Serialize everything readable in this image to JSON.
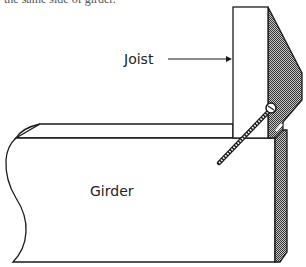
{
  "caption": {
    "partial_text": "the same side of girder."
  },
  "diagram": {
    "labels": {
      "joist": "Joist",
      "girder": "Girder"
    },
    "colors": {
      "stroke": "#1a1a1a",
      "shade": "#7a7a7a",
      "background": "#ffffff"
    },
    "parts": [
      "joist",
      "hanger-bracket",
      "girder",
      "screw"
    ]
  }
}
